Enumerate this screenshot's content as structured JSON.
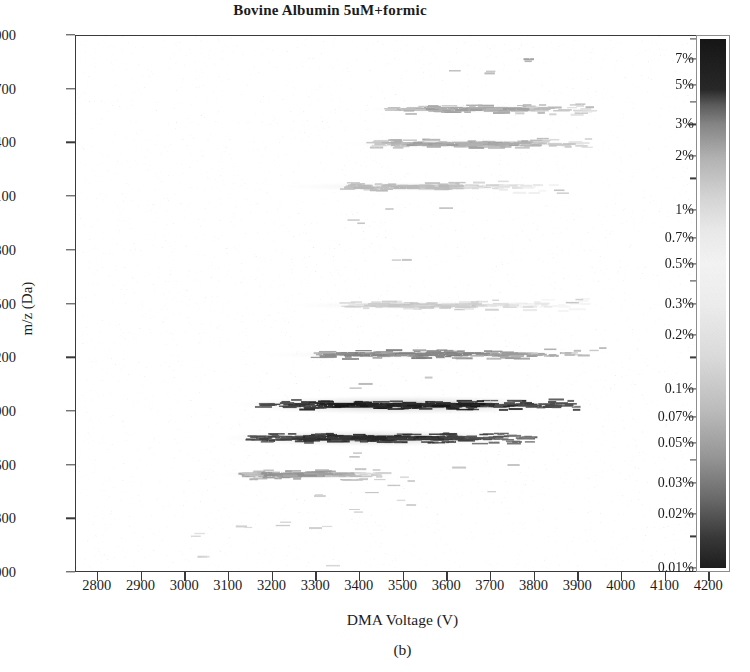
{
  "chart_data": {
    "type": "heatmap",
    "title": "Bovine Albumin 5uM+formic",
    "subfigure_label": "(b)",
    "xlabel": "DMA Voltage (V)",
    "ylabel": "m/z (Da)",
    "xlim": [
      2750,
      4250
    ],
    "ylim": [
      3000,
      6000
    ],
    "grid": false,
    "xticks": [
      2800,
      2900,
      3000,
      3100,
      3200,
      3300,
      3400,
      3500,
      3600,
      3700,
      3800,
      3900,
      4000,
      4100,
      4200
    ],
    "yticks": [
      3000,
      3300,
      3600,
      3900,
      4200,
      4500,
      4800,
      5100,
      5400,
      5700,
      6000
    ],
    "colorbar": {
      "scale": "log",
      "units": "percent",
      "position": "right",
      "vmin": 0.01,
      "vmax": 9.0,
      "labeled_ticks": [
        "7%",
        "5%",
        "3%",
        "2%",
        "1%",
        "0.7%",
        "0.5%",
        "0.3%",
        "0.2%",
        "0.1%",
        "0.07%",
        "0.05%",
        "0.03%",
        "0.02%",
        "0.01%"
      ],
      "labeled_values": [
        7,
        5,
        3,
        2,
        1,
        0.7,
        0.5,
        0.3,
        0.2,
        0.1,
        0.07,
        0.05,
        0.03,
        0.02,
        0.01
      ],
      "minor_values": [
        9,
        4,
        1.5,
        0.4,
        0.15,
        0.04,
        0.015
      ]
    },
    "marker_style": "horizontal-dash",
    "bands": [
      {
        "name": "band-3750",
        "mz_center": 3745,
        "voltage_center": 3430,
        "voltage_span": [
          3150,
          3800
        ],
        "peak_percent": 5.0
      },
      {
        "name": "band-3930",
        "mz_center": 3930,
        "voltage_center": 3500,
        "voltage_span": [
          3180,
          3900
        ],
        "peak_percent": 7.0
      },
      {
        "name": "band-4210",
        "mz_center": 4215,
        "voltage_center": 3520,
        "voltage_span": [
          3290,
          3930
        ],
        "peak_percent": 0.5
      },
      {
        "name": "band-3540",
        "mz_center": 3540,
        "voltage_center": 3250,
        "voltage_span": [
          3140,
          3460
        ],
        "peak_percent": 0.3
      },
      {
        "name": "band-5400",
        "mz_center": 5395,
        "voltage_center": 3640,
        "voltage_span": [
          3420,
          3930
        ],
        "peak_percent": 0.2
      },
      {
        "name": "band-5580",
        "mz_center": 5590,
        "voltage_center": 3660,
        "voltage_span": [
          3470,
          3940
        ],
        "peak_percent": 0.2
      },
      {
        "name": "band-5150",
        "mz_center": 5155,
        "voltage_center": 3500,
        "voltage_span": [
          3370,
          3880
        ],
        "peak_percent": 0.1
      },
      {
        "name": "band-4480",
        "mz_center": 4490,
        "voltage_center": 3540,
        "voltage_span": [
          3370,
          3940
        ],
        "peak_percent": 0.07
      }
    ],
    "points": [
      {
        "v": 3040,
        "mz": 3080,
        "pct": 0.05
      },
      {
        "v": 3025,
        "mz": 3195,
        "pct": 0.04
      },
      {
        "v": 3130,
        "mz": 3250,
        "pct": 0.05
      },
      {
        "v": 3225,
        "mz": 3255,
        "pct": 0.06
      },
      {
        "v": 3340,
        "mz": 3030,
        "pct": 0.04
      },
      {
        "v": 3300,
        "mz": 3240,
        "pct": 0.05
      },
      {
        "v": 3390,
        "mz": 3345,
        "pct": 0.05
      },
      {
        "v": 3520,
        "mz": 3370,
        "pct": 0.05
      },
      {
        "v": 3310,
        "mz": 3420,
        "pct": 0.05
      },
      {
        "v": 3430,
        "mz": 3440,
        "pct": 0.07
      },
      {
        "v": 3480,
        "mz": 3480,
        "pct": 0.07
      },
      {
        "v": 3705,
        "mz": 3445,
        "pct": 0.05
      },
      {
        "v": 3630,
        "mz": 3580,
        "pct": 0.07
      },
      {
        "v": 3755,
        "mz": 3595,
        "pct": 0.07
      },
      {
        "v": 3390,
        "mz": 3640,
        "pct": 0.1
      },
      {
        "v": 3520,
        "mz": 3505,
        "pct": 0.05
      },
      {
        "v": 3415,
        "mz": 4050,
        "pct": 0.1
      },
      {
        "v": 3560,
        "mz": 4085,
        "pct": 0.07
      },
      {
        "v": 3960,
        "mz": 4250,
        "pct": 0.1
      },
      {
        "v": 3890,
        "mz": 4505,
        "pct": 0.07
      },
      {
        "v": 3510,
        "mz": 4745,
        "pct": 0.07
      },
      {
        "v": 3405,
        "mz": 4950,
        "pct": 0.07
      },
      {
        "v": 3470,
        "mz": 5030,
        "pct": 0.07
      },
      {
        "v": 3600,
        "mz": 5035,
        "pct": 0.07
      },
      {
        "v": 3860,
        "mz": 5135,
        "pct": 0.07
      },
      {
        "v": 3620,
        "mz": 5805,
        "pct": 0.1
      },
      {
        "v": 3700,
        "mz": 5790,
        "pct": 0.1
      },
      {
        "v": 3790,
        "mz": 5870,
        "pct": 0.2
      },
      {
        "v": 3930,
        "mz": 5600,
        "pct": 0.1
      }
    ]
  }
}
